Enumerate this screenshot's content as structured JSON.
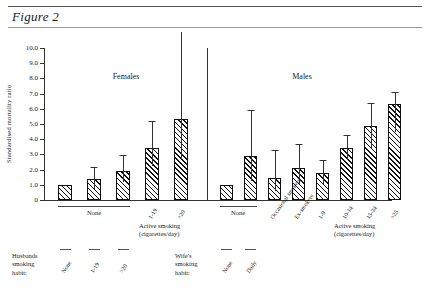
{
  "figure": {
    "title": "Figure 2"
  },
  "chart_data": {
    "type": "bar",
    "title": "Figure 2",
    "xlabel": "",
    "ylabel": "Standardised mortality ratio",
    "ylim": [
      0,
      10.0
    ],
    "ytick_labels": [
      "0",
      "1.0",
      "2.0",
      "3.0",
      "4.0",
      "5.0",
      "6.0",
      "7.0",
      "8.0",
      "9.0",
      "10.0"
    ],
    "ytick_values": [
      0,
      1.0,
      2.0,
      3.0,
      4.0,
      5.0,
      6.0,
      7.0,
      8.0,
      9.0,
      10.0
    ],
    "grid": false,
    "legend": "none",
    "panels": [
      {
        "name": "Females",
        "habit_row_label": "Husbands\nsmoking\nhabit:",
        "habit_row_label_lines": [
          "Husbands",
          "smoking",
          "habit:"
        ],
        "bracket_label": "None",
        "dose_caption_lines": [
          "Active smoking",
          "(cigarettes/day)"
        ],
        "categories": [
          "None",
          "1-19",
          ">20",
          "1-19",
          ">20"
        ],
        "habit_categories": [
          "None",
          "1-19",
          ">20"
        ],
        "values": [
          1.0,
          1.4,
          1.9,
          3.4,
          5.3
        ],
        "ci_low": [
          1.0,
          0.75,
          1.2,
          2.25,
          2.7
        ],
        "ci_high": [
          1.0,
          2.15,
          2.95,
          5.2,
          11.4
        ],
        "ci_high_clipped": [
          false,
          false,
          false,
          false,
          true
        ]
      },
      {
        "name": "Males",
        "habit_row_label_lines": [
          "Wife's",
          "smoking",
          "habit:"
        ],
        "bracket_label": "None",
        "dose_caption_lines": [
          "Active smoking",
          "(cigarettes/day)"
        ],
        "categories": [
          "None",
          "Occasional smokers",
          "Ex-smokers",
          "1-9",
          "10-14",
          "15-24",
          ">25"
        ],
        "habit_categories": [
          "None",
          "Daily"
        ],
        "values": [
          1.0,
          2.9,
          1.45,
          2.1,
          1.8,
          3.45,
          4.9,
          6.3
        ],
        "bar_categories": [
          "None",
          "Daily",
          "Occasional smokers",
          "Ex-smokers",
          "1-9",
          "10-14",
          "15-24",
          ">25"
        ],
        "ci_low": [
          1.0,
          1.25,
          0.6,
          1.05,
          1.05,
          2.65,
          3.45,
          4.45
        ],
        "ci_high": [
          1.0,
          5.95,
          3.3,
          3.7,
          2.65,
          4.3,
          6.4,
          7.1
        ],
        "ci_high_clipped": [
          false,
          false,
          false,
          false,
          false,
          false,
          false,
          false
        ]
      }
    ]
  }
}
